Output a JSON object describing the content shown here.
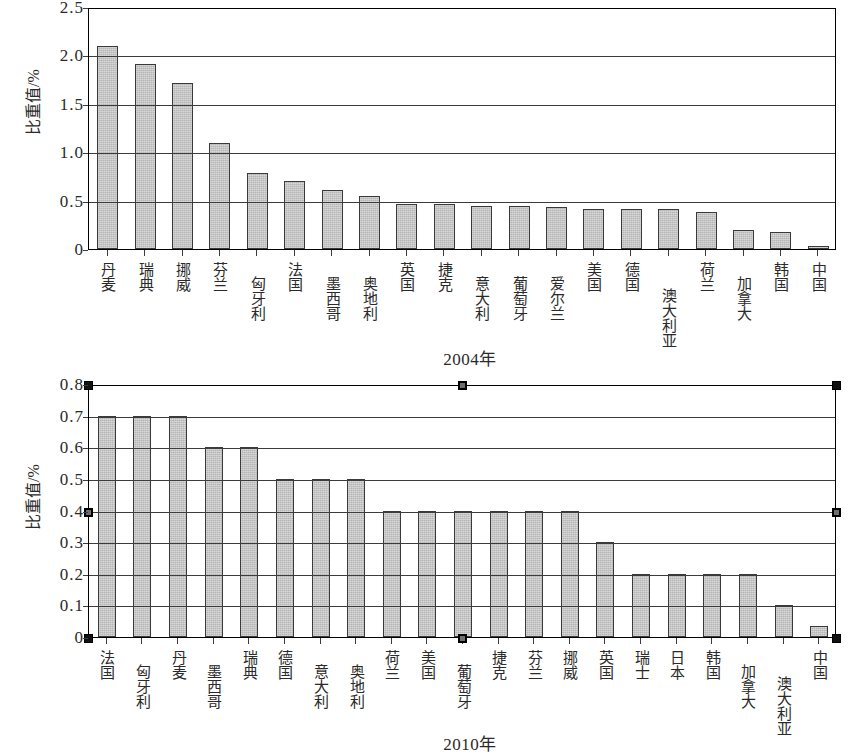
{
  "chart_data": [
    {
      "type": "bar",
      "id": "chart-2004",
      "title": "2004年",
      "xlabel": "2004年",
      "ylabel": "比重值/%",
      "ylim": [
        0,
        2.5
      ],
      "ytick_values": [
        "2.5",
        "2.0",
        "1.5",
        "1.0",
        "0.5",
        "0"
      ],
      "ytick_numeric": [
        2.5,
        2.0,
        1.5,
        1.0,
        0.5,
        0
      ],
      "grid": true,
      "legend": "none",
      "categories": [
        "丹麦",
        "瑞典",
        "挪威",
        "芬兰",
        "匈牙利",
        "法国",
        "墨西哥",
        "奥地利",
        "英国",
        "捷克",
        "意大利",
        "葡萄牙",
        "爱尔兰",
        "美国",
        "德国",
        "澳大利亚",
        "荷兰",
        "加拿大",
        "韩国",
        "中国"
      ],
      "values": [
        2.1,
        1.91,
        1.71,
        1.1,
        0.79,
        0.7,
        0.61,
        0.55,
        0.47,
        0.47,
        0.44,
        0.44,
        0.43,
        0.41,
        0.41,
        0.41,
        0.38,
        0.2,
        0.18,
        0.03
      ]
    },
    {
      "type": "bar",
      "id": "chart-2010",
      "title": "2010年",
      "xlabel": "2010年",
      "ylabel": "比重值/%",
      "ylim": [
        0,
        0.8
      ],
      "ytick_values": [
        "0.8",
        "0.7",
        "0.6",
        "0.5",
        "0.4",
        "0.3",
        "0.2",
        "0.1",
        "0"
      ],
      "ytick_numeric": [
        0.8,
        0.7,
        0.6,
        0.5,
        0.4,
        0.3,
        0.2,
        0.1,
        0
      ],
      "grid": true,
      "legend": "none",
      "selected": true,
      "categories": [
        "法国",
        "匈牙利",
        "丹麦",
        "墨西哥",
        "瑞典",
        "德国",
        "意大利",
        "奥地利",
        "荷兰",
        "美国",
        "葡萄牙",
        "捷克",
        "芬兰",
        "挪威",
        "英国",
        "瑞士",
        "日本",
        "韩国",
        "加拿大",
        "澳大利亚",
        "中国"
      ],
      "values": [
        0.7,
        0.7,
        0.7,
        0.6,
        0.6,
        0.5,
        0.5,
        0.5,
        0.4,
        0.4,
        0.4,
        0.4,
        0.4,
        0.4,
        0.3,
        0.2,
        0.2,
        0.2,
        0.2,
        0.1,
        0.035
      ]
    }
  ],
  "colors": {
    "bar_fill": "#b5b5b5",
    "bar_stroke": "#3a3a3a",
    "grid": "#3c3c3c",
    "axis": "#000000",
    "text": "#2a2a2a",
    "handle": "#111111"
  }
}
